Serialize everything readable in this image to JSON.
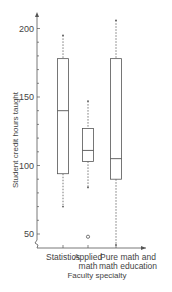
{
  "chart_data": {
    "type": "boxplot",
    "title": "",
    "xlabel": "Faculty specialty",
    "ylabel": "Student credit hours taught",
    "ylim": [
      40,
      210
    ],
    "yticks": [
      50,
      100,
      150,
      200
    ],
    "y_minor_tick_step": 10,
    "grid": false,
    "categories": [
      "Statistics",
      "Applied math",
      "Pure math and math education"
    ],
    "category_lines": [
      [
        "Statistics"
      ],
      [
        "Applied",
        "math"
      ],
      [
        "Pure math and",
        "math education"
      ]
    ],
    "series": [
      {
        "name": "Statistics",
        "min": 70,
        "q1": 94,
        "median": 140,
        "q3": 178,
        "max": 195,
        "outliers": []
      },
      {
        "name": "Applied math",
        "min": 84,
        "q1": 103,
        "median": 111,
        "q3": 127,
        "max": 147,
        "outliers": [
          48
        ]
      },
      {
        "name": "Pure math and math education",
        "min": 42,
        "q1": 90,
        "median": 105,
        "q3": 178,
        "max": 206,
        "outliers": []
      }
    ]
  },
  "colors": {
    "line": "#555555",
    "background": "#ffffff"
  }
}
